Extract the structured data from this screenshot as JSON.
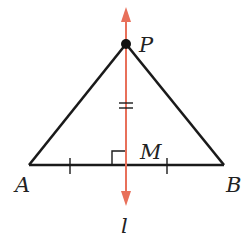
{
  "diagram": {
    "type": "geometry",
    "colors": {
      "segments": "#1a1a1a",
      "bisector_line": "#e8705a",
      "point": "#111111"
    },
    "points": {
      "P": {
        "label": "P",
        "x": 126,
        "y": 44
      },
      "A": {
        "label": "A",
        "x": 29,
        "y": 165
      },
      "B": {
        "label": "B",
        "x": 224,
        "y": 165
      },
      "M": {
        "label": "M",
        "x": 126,
        "y": 165
      }
    },
    "segments": [
      {
        "from": "P",
        "to": "A"
      },
      {
        "from": "P",
        "to": "B"
      },
      {
        "from": "A",
        "to": "B"
      }
    ],
    "line": {
      "label": "l",
      "direction": "vertical",
      "through": [
        "P",
        "M"
      ],
      "arrows": "both"
    },
    "markings": {
      "right_angle_at": "M",
      "congruent_segments_single_tick": [
        "AM",
        "MB"
      ],
      "double_tick_on": "PM"
    },
    "labels": {
      "P": "P",
      "A": "A",
      "B": "B",
      "M": "M",
      "l": "l"
    }
  }
}
